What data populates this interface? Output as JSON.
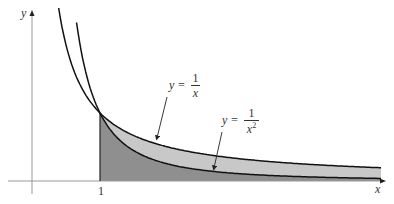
{
  "figure": {
    "axes": {
      "x_label": "x",
      "y_label": "y",
      "tick_x": "1"
    },
    "curves": [
      {
        "name": "1/x",
        "label_lhs": "y =",
        "numerator": "1",
        "denominator": "x",
        "exponent": ""
      },
      {
        "name": "1/x^2",
        "label_lhs": "y =",
        "numerator": "1",
        "denominator": "x",
        "exponent": "2"
      }
    ],
    "shading": {
      "between_curves_color": "#c8c8c8",
      "under_lower_curve_color": "#8f8f8f",
      "interval": "x from 1 to infinity"
    }
  }
}
